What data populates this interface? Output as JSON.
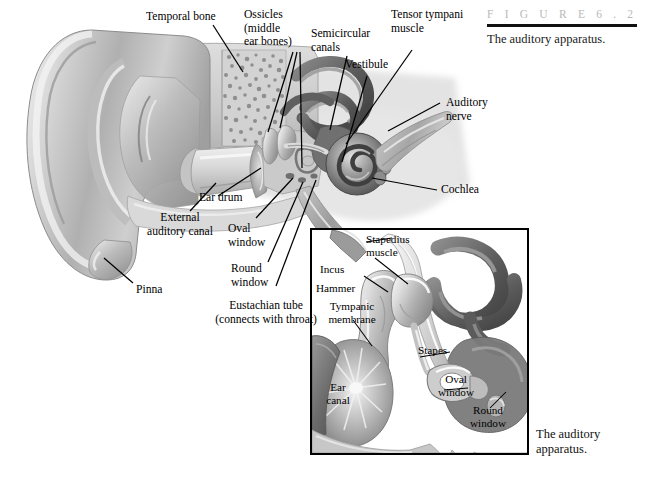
{
  "figure": {
    "kicker": "F I G U R E      6 . 2",
    "caption": "The auditory apparatus.",
    "inset_caption": "The auditory\napparatus."
  },
  "main_labels": [
    {
      "id": "temporal-bone",
      "text": "Temporal bone"
    },
    {
      "id": "ossicles",
      "text": "Ossicles\n(middle\near bones)"
    },
    {
      "id": "semicircular",
      "text": "Semicircular\ncanals"
    },
    {
      "id": "vestibule",
      "text": "Vestibule"
    },
    {
      "id": "tensor-tympani",
      "text": "Tensor tympani\nmuscle"
    },
    {
      "id": "auditory-nerve",
      "text": "Auditory\nnerve"
    },
    {
      "id": "cochlea",
      "text": "Cochlea"
    },
    {
      "id": "ear-drum",
      "text": "Ear drum"
    },
    {
      "id": "external-canal",
      "text": "External\nauditory canal"
    },
    {
      "id": "oval-window",
      "text": "Oval\nwindow"
    },
    {
      "id": "round-window",
      "text": "Round\nwindow"
    },
    {
      "id": "pinna",
      "text": "Pinna"
    },
    {
      "id": "eustachian-tube",
      "text": "Eustachian tube\n(connects with throat)"
    }
  ],
  "inset_labels": [
    {
      "id": "stapedius-muscle",
      "text": "Stapedius\nmuscle"
    },
    {
      "id": "incus",
      "text": "Incus"
    },
    {
      "id": "hammer",
      "text": "Hammer"
    },
    {
      "id": "tympanic-membrane",
      "text": "Tympanic\nmembrane"
    },
    {
      "id": "ear-canal",
      "text": "Ear\ncanal"
    },
    {
      "id": "stapes",
      "text": "Stapes"
    },
    {
      "id": "inset-oval-window",
      "text": "Oval\nwindow"
    },
    {
      "id": "inset-round-window",
      "text": "Round\nwindow"
    }
  ],
  "colors": {
    "page_background": "#ffffff",
    "kicker_gray": "#b9b9b9",
    "rule_black": "#111111",
    "label_black": "#000000",
    "inset_border": "#000000",
    "tissue_light": "#d8d8d8",
    "tissue_mid": "#a8a8a8",
    "tissue_dark": "#6e6e6e",
    "tissue_darkest": "#454545",
    "shadow_gray": "#cfcfcf"
  }
}
